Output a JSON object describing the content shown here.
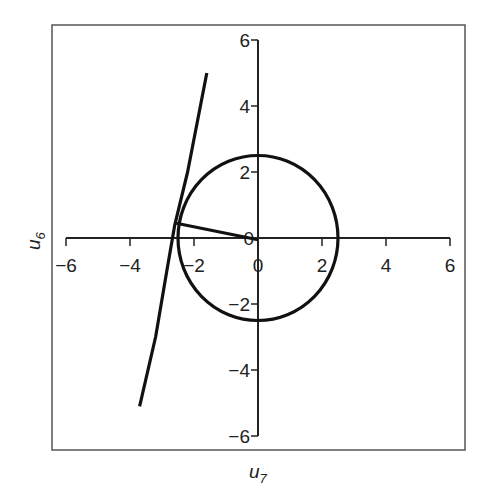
{
  "chart_data": {
    "type": "line",
    "title": "",
    "xlabel": "u",
    "xlabel_sub": "7",
    "ylabel": "u",
    "ylabel_sub": "6",
    "xlim": [
      -6,
      6
    ],
    "ylim": [
      -6,
      6
    ],
    "grid": false,
    "legend": null,
    "x_ticks": [
      -6,
      -4,
      -2,
      0,
      2,
      4,
      6
    ],
    "x_tick_labels": [
      "−6",
      "−4",
      "−2",
      "0",
      "2",
      "4",
      "6"
    ],
    "y_ticks": [
      6,
      4,
      2,
      0,
      -2,
      -4,
      -6
    ],
    "y_tick_labels": [
      "6",
      "4",
      "2",
      "0",
      "−2",
      "−4",
      "−6"
    ],
    "series": [
      {
        "name": "circle",
        "kind": "circle",
        "center": [
          0,
          0
        ],
        "radius": 2.5
      },
      {
        "name": "tangent-curve",
        "kind": "polyline",
        "points": [
          [
            -1.6,
            5.0
          ],
          [
            -2.2,
            2.0
          ],
          [
            -2.6,
            0.4
          ],
          [
            -2.85,
            -1.0
          ],
          [
            -3.2,
            -3.0
          ],
          [
            -3.7,
            -5.1
          ]
        ]
      },
      {
        "name": "radius-segment",
        "kind": "segment",
        "points": [
          [
            -2.55,
            0.45
          ],
          [
            0,
            -0.05
          ]
        ]
      }
    ]
  },
  "style": {
    "line_color": "#111111",
    "frame_color": "#555555",
    "axis_color": "#222222"
  }
}
